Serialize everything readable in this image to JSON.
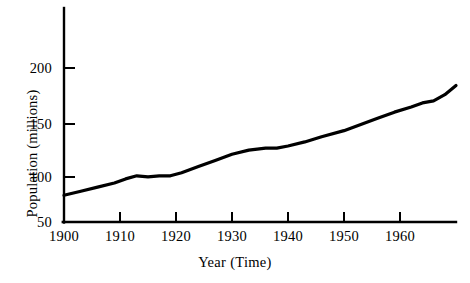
{
  "chart_data": {
    "type": "line",
    "title": "",
    "xlabel": "Year (Time)",
    "ylabel": "Population (millions)",
    "xlim": [
      1900,
      1970
    ],
    "ylim": [
      50,
      215
    ],
    "grid": false,
    "legend": null,
    "xticks": [
      1900,
      1910,
      1920,
      1930,
      1940,
      1950,
      1960
    ],
    "xtick_labels": [
      "1900",
      "1910",
      "1920",
      "1930",
      "1940",
      "1950",
      "1960"
    ],
    "yticks": [
      50,
      100,
      150,
      200
    ],
    "ytick_labels": [
      "50",
      "100",
      "150",
      "200"
    ],
    "line_color": "#000000",
    "line_width": 3,
    "series": [
      {
        "name": "Population",
        "x": [
          1900,
          1903,
          1906,
          1909,
          1911,
          1913,
          1915,
          1917,
          1919,
          1921,
          1924,
          1927,
          1930,
          1933,
          1936,
          1938,
          1940,
          1943,
          1946,
          1950,
          1953,
          1956,
          1959,
          1962,
          1964,
          1966,
          1968,
          1970
        ],
        "values": [
          76,
          80,
          84,
          88,
          92,
          95,
          94,
          95,
          95,
          98,
          104,
          110,
          116,
          120,
          122,
          122,
          124,
          128,
          133,
          139,
          145,
          151,
          157,
          162,
          166,
          168,
          174,
          183
        ]
      }
    ]
  },
  "axes": {
    "y_title": "Population (millions)",
    "x_title": "Year (Time)"
  }
}
